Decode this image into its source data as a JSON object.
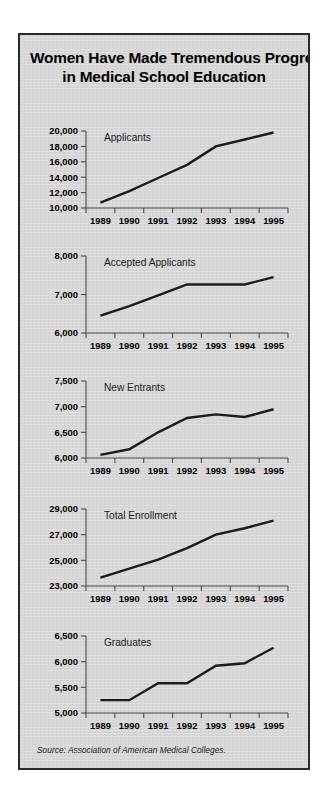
{
  "panel": {
    "title_line_1": "Women Have Made Tremendous Progress",
    "title_line_2": "in Medical School Education",
    "source_note": "Source: Association of American Medical Colleges.",
    "background_color": "#d6d6d6",
    "border_color": "#2a2a2a",
    "line_color": "#1c1c1c",
    "axis_color": "#4a4a4a"
  },
  "chart_data": [
    {
      "type": "line",
      "title": "Applicants",
      "xlabel": "",
      "ylabel": "",
      "grid": false,
      "legend": "none",
      "categories": [
        "1989",
        "1990",
        "1991",
        "1992",
        "1993",
        "1994",
        "1995"
      ],
      "x": [
        1989,
        1990,
        1991,
        1992,
        1993,
        1994,
        1995
      ],
      "values": [
        10700,
        12200,
        13900,
        15600,
        18000,
        18900,
        19800
      ],
      "ylim": [
        10000,
        20000
      ],
      "yticks": [
        10000,
        12000,
        14000,
        16000,
        18000,
        20000
      ],
      "ytick_labels": [
        "10,000",
        "12,000",
        "14,000",
        "16,000",
        "18,000",
        "20,000"
      ]
    },
    {
      "type": "line",
      "title": "Accepted Applicants",
      "xlabel": "",
      "ylabel": "",
      "grid": false,
      "legend": "none",
      "categories": [
        "1989",
        "1990",
        "1991",
        "1992",
        "1993",
        "1994",
        "1995"
      ],
      "x": [
        1989,
        1990,
        1991,
        1992,
        1993,
        1994,
        1995
      ],
      "values": [
        6450,
        6700,
        6980,
        7260,
        7260,
        7260,
        7450
      ],
      "ylim": [
        6000,
        8000
      ],
      "yticks": [
        6000,
        7000,
        8000
      ],
      "ytick_labels": [
        "6,000",
        "7,000",
        "8,000"
      ]
    },
    {
      "type": "line",
      "title": "New Entrants",
      "xlabel": "",
      "ylabel": "",
      "grid": false,
      "legend": "none",
      "categories": [
        "1989",
        "1990",
        "1991",
        "1992",
        "1993",
        "1994",
        "1995"
      ],
      "x": [
        1989,
        1990,
        1991,
        1992,
        1993,
        1994,
        1995
      ],
      "values": [
        6060,
        6170,
        6500,
        6780,
        6850,
        6800,
        6950
      ],
      "ylim": [
        6000,
        7500
      ],
      "yticks": [
        6000,
        6500,
        7000,
        7500
      ],
      "ytick_labels": [
        "6,000",
        "6,500",
        "7,000",
        "7,500"
      ]
    },
    {
      "type": "line",
      "title": "Total Enrollment",
      "xlabel": "",
      "ylabel": "",
      "grid": false,
      "legend": "none",
      "categories": [
        "1989",
        "1990",
        "1991",
        "1992",
        "1993",
        "1994",
        "1995"
      ],
      "x": [
        1989,
        1990,
        1991,
        1992,
        1993,
        1994,
        1995
      ],
      "values": [
        23650,
        24350,
        25050,
        25950,
        27000,
        27500,
        28100
      ],
      "ylim": [
        23000,
        29000
      ],
      "yticks": [
        23000,
        25000,
        27000,
        29000
      ],
      "ytick_labels": [
        "23,000",
        "25,000",
        "27,000",
        "29,000"
      ]
    },
    {
      "type": "line",
      "title": "Graduates",
      "xlabel": "",
      "ylabel": "",
      "grid": false,
      "legend": "none",
      "categories": [
        "1989",
        "1990",
        "1991",
        "1992",
        "1993",
        "1994",
        "1995"
      ],
      "x": [
        1989,
        1990,
        1991,
        1992,
        1993,
        1994,
        1995
      ],
      "values": [
        5250,
        5250,
        5580,
        5580,
        5920,
        5970,
        6270
      ],
      "ylim": [
        5000,
        6500
      ],
      "yticks": [
        5000,
        5500,
        6000,
        6500
      ],
      "ytick_labels": [
        "5,000",
        "5,500",
        "6,000",
        "6,500"
      ]
    }
  ],
  "chart_layout": {
    "tops": [
      88,
      213,
      338,
      466,
      593
    ],
    "height": 108,
    "plot_left": 66,
    "plot_right": 268,
    "plot_top": 8,
    "plot_bottom": 85
  }
}
